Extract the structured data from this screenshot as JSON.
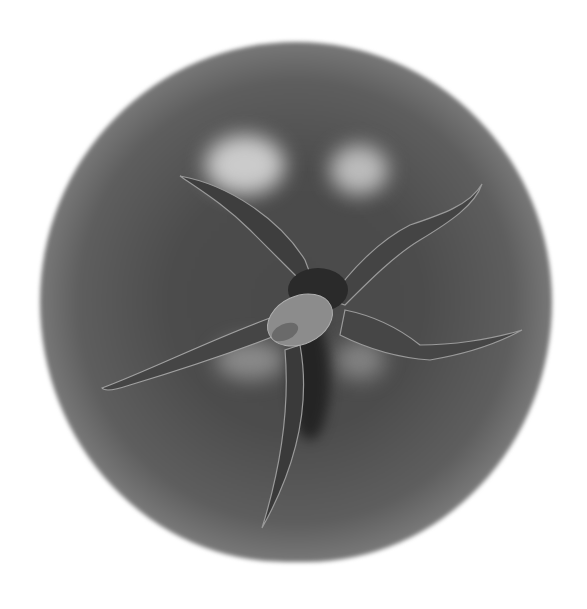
{
  "image": {
    "subject": "tomato top view with stem and sepals",
    "style": "grayscale photograph",
    "colors": {
      "background": "#ffffff",
      "fruit_core": "#4a4a4a",
      "fruit_edge": "#c8c8c8",
      "highlight": "#e1e1e1",
      "sepal": "#3e3e3e",
      "sepal_edge": "#9a9a9a",
      "stem": "#8c8c8c"
    },
    "elements": [
      "tomato-body",
      "specular-highlights",
      "five-sepals",
      "stem-stub"
    ]
  }
}
